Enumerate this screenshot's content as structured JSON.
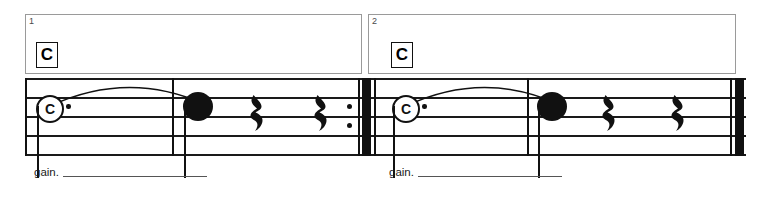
{
  "score": {
    "title_visible": false,
    "colors": {
      "ink": "#111111",
      "staff_line": "#1a1a1a",
      "bracket": "#9a9a9a",
      "tech_line": "#555555",
      "paper": "#ffffff"
    },
    "systems": [
      {
        "measure_number": "1",
        "chord_symbol": "C",
        "technique_text": "gain.",
        "notes": [
          {
            "label": "C",
            "style": "circled-notehead",
            "dotted": true
          },
          {
            "label": "",
            "style": "filled-notehead",
            "dotted": false
          }
        ],
        "rests": [
          {
            "type": "quarter-rest"
          },
          {
            "type": "quarter-rest"
          }
        ],
        "end_barline": "repeat-end",
        "tie": true
      },
      {
        "measure_number": "2",
        "chord_symbol": "C",
        "technique_text": "gain.",
        "notes": [
          {
            "label": "C",
            "style": "circled-notehead",
            "dotted": true
          },
          {
            "label": "",
            "style": "filled-notehead",
            "dotted": false
          }
        ],
        "rests": [
          {
            "type": "quarter-rest"
          },
          {
            "type": "quarter-rest"
          }
        ],
        "end_barline": "final",
        "tie": true
      }
    ]
  }
}
